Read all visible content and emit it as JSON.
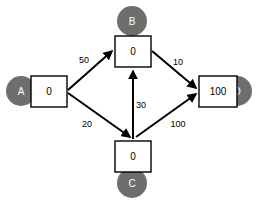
{
  "diagram": {
    "title": "",
    "type": "directed-weighted-graph",
    "colors": {
      "node_circle_fill": "#6e6e6e",
      "node_circle_label": "#ffffff",
      "node_box_fill": "#ffffff",
      "edge_stroke": "#000000",
      "background": "#ffffff"
    },
    "nodes": [
      {
        "id": "A",
        "label": "A",
        "value": "0",
        "circle": {
          "cx": 21,
          "cy": 91,
          "r": 15
        },
        "box": {
          "x": 31,
          "y": 76,
          "w": 36,
          "h": 31
        },
        "circle_side": "left"
      },
      {
        "id": "B",
        "label": "B",
        "value": "0",
        "circle": {
          "cx": 132,
          "cy": 21,
          "r": 15
        },
        "box": {
          "x": 115,
          "y": 36,
          "w": 36,
          "h": 31
        },
        "circle_side": "top"
      },
      {
        "id": "C",
        "label": "C",
        "value": "0",
        "circle": {
          "cx": 132,
          "cy": 183,
          "r": 15
        },
        "box": {
          "x": 115,
          "y": 141,
          "w": 36,
          "h": 31
        },
        "circle_side": "bottom"
      },
      {
        "id": "D",
        "label": "D",
        "value": "100",
        "circle": {
          "cx": 237,
          "cy": 91,
          "r": 15
        },
        "box": {
          "x": 199,
          "y": 76,
          "w": 38,
          "h": 31
        },
        "circle_side": "right"
      }
    ],
    "edges": [
      {
        "id": "a-b",
        "from": "A",
        "to": "B",
        "weight": "50",
        "path": "M 68 90 L 112 51",
        "label_x": 84,
        "label_y": 60,
        "arrow": true
      },
      {
        "id": "a-c",
        "from": "A",
        "to": "C",
        "weight": "20",
        "path": "M 68 93 L 130 137",
        "label_x": 87,
        "label_y": 124,
        "arrow": true
      },
      {
        "id": "c-b",
        "from": "C",
        "to": "B",
        "weight": "30",
        "path": "M 133 139 L 133 71",
        "label_x": 141,
        "label_y": 105,
        "arrow": true
      },
      {
        "id": "b-d",
        "from": "B",
        "to": "D",
        "weight": "10",
        "path": "M 152 51 L 196 88",
        "label_x": 178,
        "label_y": 62,
        "arrow": true
      },
      {
        "id": "c-d",
        "from": "C",
        "to": "D",
        "weight": "100",
        "path": "M 136 137 L 196 94",
        "label_x": 178,
        "label_y": 124,
        "arrow": true
      }
    ]
  }
}
